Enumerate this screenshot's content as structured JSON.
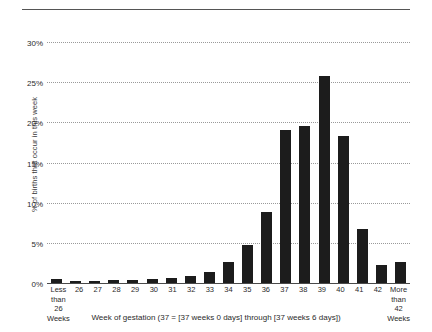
{
  "chart_data": {
    "type": "bar",
    "title": "",
    "xlabel": "Week of gestation (37 = [37 weeks 0 days] through [37 weeks 6 days])",
    "ylabel": "% of births that occur in this week",
    "ylim": [
      0,
      30
    ],
    "ytick_labels": [
      "30%",
      "25%",
      "20%",
      "15%",
      "10%",
      "5%",
      "0%"
    ],
    "ytick_values": [
      30,
      25,
      20,
      15,
      10,
      5,
      0
    ],
    "grid": true,
    "legend": "none",
    "bar_color": "#1c1c1c",
    "categories": [
      "Less than 26 Weeks",
      "26",
      "27",
      "28",
      "29",
      "30",
      "31",
      "32",
      "33",
      "34",
      "35",
      "36",
      "37",
      "38",
      "39",
      "40",
      "41",
      "42",
      "More than 42 Weeks"
    ],
    "category_lines": [
      [
        "Less",
        "than",
        "26 Weeks"
      ],
      [
        "26"
      ],
      [
        "27"
      ],
      [
        "28"
      ],
      [
        "29"
      ],
      [
        "30"
      ],
      [
        "31"
      ],
      [
        "32"
      ],
      [
        "33"
      ],
      [
        "34"
      ],
      [
        "35"
      ],
      [
        "36"
      ],
      [
        "37"
      ],
      [
        "38"
      ],
      [
        "39"
      ],
      [
        "40"
      ],
      [
        "41"
      ],
      [
        "42"
      ],
      [
        "More",
        "than",
        "42 Weeks"
      ]
    ],
    "values": [
      0.5,
      0.3,
      0.3,
      0.4,
      0.4,
      0.5,
      0.6,
      0.9,
      1.4,
      2.6,
      4.7,
      8.8,
      19.0,
      19.6,
      25.8,
      18.3,
      6.7,
      2.2,
      2.6
    ]
  }
}
